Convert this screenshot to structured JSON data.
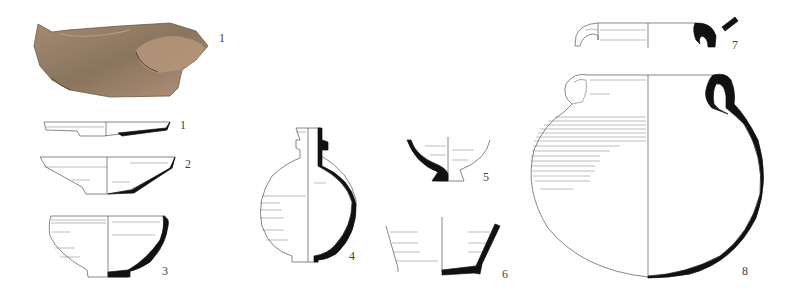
{
  "plate": {
    "background": "#ffffff",
    "ink_color": "#111111",
    "line_color": "#555555",
    "figures": [
      {
        "id": "photo-1",
        "label": "1",
        "type": "photograph",
        "description": "pottery sherd photograph",
        "colors": [
          "#9c8066",
          "#7f6a55",
          "#b8977a"
        ]
      },
      {
        "id": "profile-1",
        "label": "1",
        "type": "profile drawing",
        "description": "shallow plate / dish"
      },
      {
        "id": "profile-2",
        "label": "2",
        "type": "profile drawing",
        "description": "flared bowl"
      },
      {
        "id": "profile-3",
        "label": "3",
        "type": "profile drawing",
        "description": "hemispherical bowl"
      },
      {
        "id": "profile-4",
        "label": "4",
        "type": "profile drawing",
        "description": "globular flask with narrow neck"
      },
      {
        "id": "profile-5",
        "label": "5",
        "type": "profile drawing",
        "description": "footed bowl base"
      },
      {
        "id": "profile-6",
        "label": "6",
        "type": "profile drawing",
        "description": "conical vessel base"
      },
      {
        "id": "profile-7",
        "label": "7",
        "type": "profile drawing",
        "description": "rim fragment with handle section"
      },
      {
        "id": "profile-8",
        "label": "8",
        "type": "profile drawing",
        "description": "two-handled globular jar"
      }
    ]
  }
}
